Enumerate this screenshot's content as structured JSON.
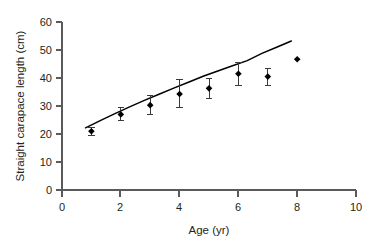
{
  "chart_data": {
    "type": "scatter",
    "title": "",
    "subtitle": "",
    "xlabel": "Age (yr)",
    "ylabel": "Straight carapace length (cm)",
    "xlim": [
      0,
      10
    ],
    "ylim": [
      0,
      60
    ],
    "xticks": [
      0,
      2,
      4,
      6,
      8,
      10
    ],
    "yticks": [
      0,
      10,
      20,
      30,
      40,
      50,
      60
    ],
    "xtick_labels": [
      "0",
      "2",
      "4",
      "6",
      "8",
      "10"
    ],
    "ytick_labels": [
      "0",
      "10",
      "20",
      "30",
      "40",
      "50",
      "60"
    ],
    "grid": false,
    "legend": null,
    "annotations": [],
    "marker_color": "#000000",
    "errorbar_color": "#3a3a3a",
    "curve_color": "#000000",
    "axis_color": "#5a5a5a",
    "series": [
      {
        "name": "Observed straight carapace length",
        "type": "scatter",
        "marker": "diamond",
        "x": [
          1,
          2,
          3,
          4,
          5,
          6,
          7,
          8
        ],
        "values": [
          21.0,
          27.0,
          30.3,
          34.3,
          36.3,
          41.5,
          40.5,
          46.7
        ],
        "errors": [
          1.5,
          2.3,
          3.5,
          5.0,
          3.5,
          4.0,
          3.0,
          0.0
        ],
        "error_low": [
          19.5,
          24.7,
          26.8,
          29.3,
          32.8,
          37.5,
          37.5,
          46.7
        ],
        "error_high": [
          22.5,
          29.3,
          33.8,
          39.3,
          39.8,
          45.5,
          43.5,
          46.7
        ]
      },
      {
        "name": "Fitted growth curve",
        "type": "line",
        "x": [
          0.8,
          1.3,
          1.8,
          2.3,
          2.8,
          3.3,
          3.8,
          4.3,
          4.8,
          5.3,
          5.8,
          6.3,
          6.8,
          7.3,
          7.8
        ],
        "values": [
          22.2,
          24.8,
          27.3,
          29.7,
          32.0,
          34.2,
          36.4,
          38.5,
          40.6,
          42.5,
          44.4,
          46.2,
          48.8,
          51.0,
          53.2
        ]
      }
    ]
  }
}
